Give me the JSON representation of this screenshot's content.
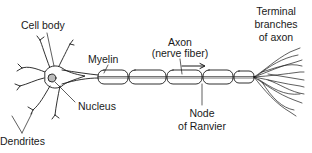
{
  "diagram": {
    "labels": {
      "cell_body": "Cell body",
      "myelin": "Myelin",
      "axon_line1": "Axon",
      "axon_line2": "(nerve fiber)",
      "terminal_line1": "Terminal",
      "terminal_line2": "branches",
      "terminal_line3": "of axon",
      "nucleus": "Nucleus",
      "node_line1": "Node",
      "node_line2": "of Ranvier",
      "dendrites": "Dendrites"
    },
    "colors": {
      "ink": "#1a1a1a",
      "background": "#ffffff"
    }
  }
}
